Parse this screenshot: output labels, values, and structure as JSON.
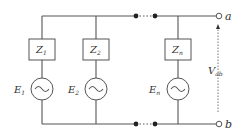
{
  "diagram": {
    "title": "",
    "branches": [
      {
        "impedance": "Z",
        "impedance_sub": "1",
        "source": "E",
        "source_sub": "1"
      },
      {
        "impedance": "Z",
        "impedance_sub": "2",
        "source": "E",
        "source_sub": "2"
      },
      {
        "impedance": "Z",
        "impedance_sub": "n",
        "source": "E",
        "source_sub": "n"
      }
    ],
    "terminals": {
      "top": "a",
      "bottom": "b"
    },
    "voltage": {
      "symbol": "V",
      "sub": "ab"
    }
  }
}
